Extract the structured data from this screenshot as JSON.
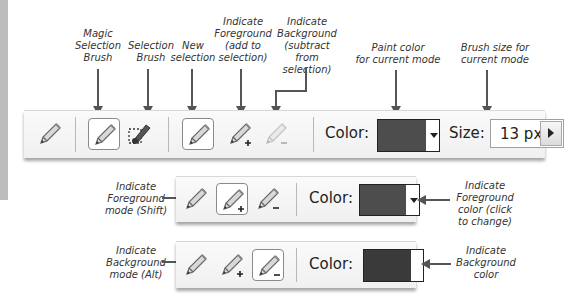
{
  "callouts": {
    "magic_selection_brush": "Magic Selection Brush",
    "selection_brush": "Selection Brush",
    "new_selection": "New selection",
    "indicate_foreground": "Indicate Foreground (add to selection)",
    "indicate_background": "Indicate Background (subtract from selection)",
    "paint_color": "Paint color for current mode",
    "brush_size": "Brush size for current mode",
    "fg_mode": "Indicate Foreground mode (Shift)",
    "fg_color": "Indicate Foreground color (click to change)",
    "bg_mode": "Indicate Background mode (Alt)",
    "bg_color": "Indicate Background color"
  },
  "callout_lines": {
    "magic_selection_brush": [
      "Magic",
      "Selection",
      "Brush"
    ],
    "selection_brush": [
      "Selection",
      "Brush"
    ],
    "new_selection": [
      "New",
      "selection"
    ],
    "indicate_foreground": [
      "Indicate",
      "Foreground",
      "(add to",
      "selection)"
    ],
    "indicate_background": [
      "Indicate",
      "Background",
      "(subtract from",
      "selection)"
    ],
    "paint_color": [
      "Paint color",
      "for current mode"
    ],
    "brush_size": [
      "Brush size for",
      "current mode"
    ],
    "fg_mode": [
      "Indicate",
      "Foreground",
      "mode (Shift)"
    ],
    "fg_color": [
      "Indicate",
      "Foreground",
      "color (click",
      "to change)"
    ],
    "bg_mode": [
      "Indicate",
      "Background",
      "mode (Alt)"
    ],
    "bg_color": [
      "Indicate",
      "Background",
      "color"
    ]
  },
  "toolbar_main": {
    "tools": [
      {
        "name": "pencil-tool",
        "icon": "pencil-icon"
      },
      {
        "name": "magic-selection-brush",
        "icon": "pencil-icon",
        "selected": true
      },
      {
        "name": "selection-brush",
        "icon": "selection-brush-icon"
      },
      {
        "name": "new-selection",
        "icon": "pencil-icon",
        "selected": true
      },
      {
        "name": "indicate-foreground",
        "icon": "pencil-plus-icon"
      },
      {
        "name": "indicate-background",
        "icon": "pencil-minus-icon",
        "disabled": true
      }
    ],
    "color_label": "Color:",
    "color_value": "#4d4d4d",
    "size_label": "Size:",
    "size_value": "13 px"
  },
  "toolbar_foreground": {
    "color_label": "Color:",
    "color_value": "#4d4d4d",
    "active_mode": "foreground"
  },
  "toolbar_background": {
    "color_label": "Color:",
    "color_value": "#3a3a3a",
    "active_mode": "background"
  }
}
